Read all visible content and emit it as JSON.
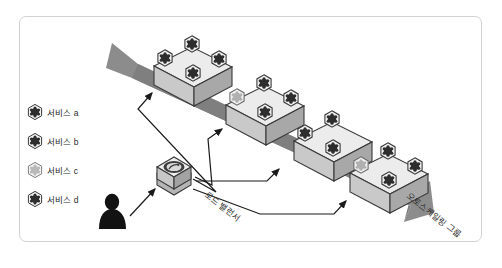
{
  "diagram": {
    "type": "architecture-isometric",
    "title": "",
    "frame": {
      "border_color": "#d2d2d2",
      "background": "#ffffff"
    },
    "palette": {
      "band_gray": "#8c8c8c",
      "band_gray_dark": "#7a7a7a",
      "box_top": "#ececec",
      "box_left": "#c9c9c9",
      "box_right": "#a8a8a8",
      "outline": "#3a3a3a",
      "icon_dark": "#2e2e2e",
      "icon_light": "#b9b9b9",
      "connector": "#1a1a1a",
      "person": "#121212",
      "text": "#2b2b2b"
    },
    "legend": {
      "items": [
        {
          "label": "서비스 a",
          "icon": "hexagon-service-icon",
          "tone": "dark"
        },
        {
          "label": "서비스 b",
          "icon": "hexagon-service-icon",
          "tone": "dark"
        },
        {
          "label": "서비스 c",
          "icon": "hexagon-service-icon",
          "tone": "light"
        },
        {
          "label": "서비스 d",
          "icon": "hexagon-service-icon",
          "tone": "dark"
        }
      ]
    },
    "actor": {
      "name": "user-person-icon",
      "label": ""
    },
    "load_balancer": {
      "label": "로드 밸런서",
      "icon": "load-balancer-icon",
      "rotation_deg": 38
    },
    "auto_scaling_group": {
      "label": "오토스케일링 그룹",
      "rotation_deg": 38,
      "arrow": "diagonal-band-arrow"
    },
    "instances": [
      {
        "id": "instance-1",
        "services_on_top": 4
      },
      {
        "id": "instance-2",
        "services_on_top": 4
      },
      {
        "id": "instance-3",
        "services_on_top": 3
      },
      {
        "id": "instance-4",
        "services_on_top": 4
      }
    ]
  }
}
